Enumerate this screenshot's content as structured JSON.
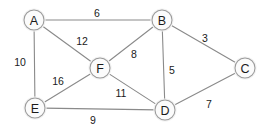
{
  "chart_data": {
    "type": "diagram",
    "title": "",
    "graph_kind": "undirected weighted graph",
    "nodes": [
      {
        "id": "A",
        "label": "A",
        "x": 34,
        "y": 20
      },
      {
        "id": "B",
        "label": "B",
        "x": 162,
        "y": 20
      },
      {
        "id": "C",
        "label": "C",
        "x": 245,
        "y": 68
      },
      {
        "id": "F",
        "label": "F",
        "x": 100,
        "y": 68
      },
      {
        "id": "D",
        "label": "D",
        "x": 165,
        "y": 110
      },
      {
        "id": "E",
        "label": "E",
        "x": 35,
        "y": 108
      }
    ],
    "node_radius": 10,
    "edges": [
      {
        "from": "A",
        "to": "B",
        "weight": 6,
        "label_x": 97,
        "label_y": 13
      },
      {
        "from": "A",
        "to": "F",
        "weight": 12,
        "label_x": 82,
        "label_y": 41
      },
      {
        "from": "A",
        "to": "E",
        "weight": 10,
        "label_x": 20,
        "label_y": 62
      },
      {
        "from": "B",
        "to": "F",
        "weight": 8,
        "label_x": 134,
        "label_y": 54
      },
      {
        "from": "B",
        "to": "C",
        "weight": 3,
        "label_x": 205,
        "label_y": 38
      },
      {
        "from": "B",
        "to": "D",
        "weight": 5,
        "label_x": 172,
        "label_y": 70
      },
      {
        "from": "F",
        "to": "E",
        "weight": 16,
        "label_x": 58,
        "label_y": 81
      },
      {
        "from": "F",
        "to": "D",
        "weight": 11,
        "label_x": 121,
        "label_y": 93
      },
      {
        "from": "E",
        "to": "D",
        "weight": 9,
        "label_x": 93,
        "label_y": 120
      },
      {
        "from": "C",
        "to": "D",
        "weight": 7,
        "label_x": 209,
        "label_y": 104
      }
    ],
    "colors": {
      "background": "#ffffff",
      "edge": "#8a8a8a",
      "node_fill": "#fbfbfb",
      "node_stroke": "#9a9a9a",
      "node_halo": "#f2f2f2",
      "text": "#1a1a1a"
    },
    "xlim": [
      0,
      270
    ],
    "ylim": [
      0,
      134
    ],
    "grid": false,
    "legend": false
  }
}
